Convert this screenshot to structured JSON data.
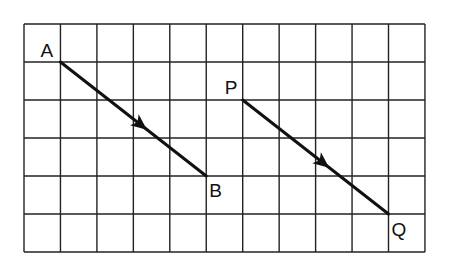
{
  "diagram": {
    "type": "vector-grid",
    "grid": {
      "columns": 11,
      "rows": 6,
      "origin_px": [
        24,
        24
      ],
      "cell_w": 36.45,
      "cell_h": 38,
      "line_color": "#222222",
      "vector_color": "#111111"
    },
    "points": [
      {
        "id": "A",
        "label": "A",
        "grid": [
          1,
          1
        ],
        "label_dx": -20,
        "label_dy": -5
      },
      {
        "id": "B",
        "label": "B",
        "grid": [
          5,
          4
        ],
        "label_dx": 3,
        "label_dy": 21
      },
      {
        "id": "P",
        "label": "P",
        "grid": [
          6,
          2
        ],
        "label_dx": -18,
        "label_dy": -6
      },
      {
        "id": "Q",
        "label": "Q",
        "grid": [
          10,
          5
        ],
        "label_dx": 3,
        "label_dy": 22
      }
    ],
    "vectors": [
      {
        "id": "AB",
        "from": "A",
        "to": "B",
        "displacement": [
          4,
          3
        ],
        "arrow_at": 0.55
      },
      {
        "id": "PQ",
        "from": "P",
        "to": "Q",
        "displacement": [
          4,
          3
        ],
        "arrow_at": 0.55
      }
    ]
  }
}
